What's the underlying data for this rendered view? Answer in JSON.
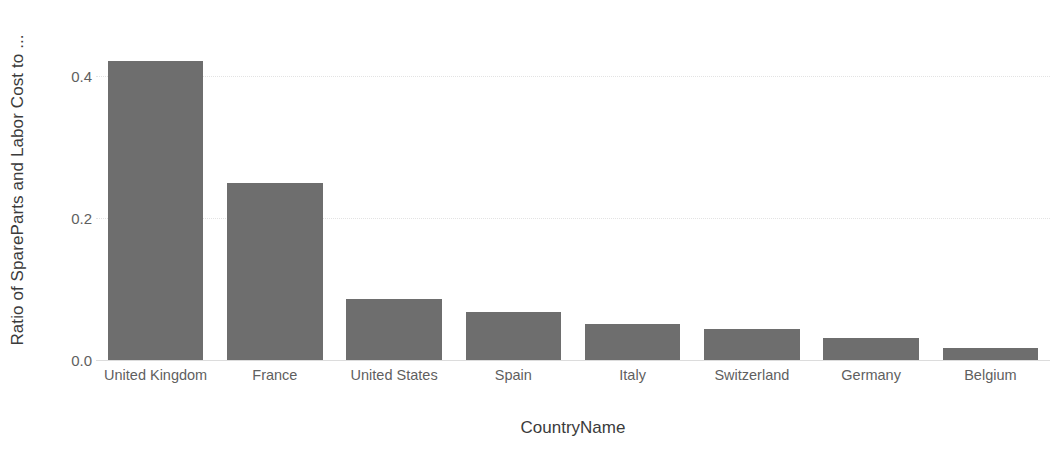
{
  "chart_data": {
    "type": "bar",
    "title": "",
    "subtitle": "",
    "xlabel": "CountryName",
    "ylabel": "Ratio of SpareParts and Labor Cost to ...",
    "categories": [
      "United Kingdom",
      "France",
      "United States",
      "Spain",
      "Italy",
      "Switzerland",
      "Germany",
      "Belgium"
    ],
    "values": [
      0.42,
      0.249,
      0.085,
      0.068,
      0.051,
      0.044,
      0.031,
      0.017
    ],
    "series": [
      {
        "name": "Ratio of SpareParts and Labor Cost to ...",
        "values": [
          0.42,
          0.249,
          0.085,
          0.068,
          0.051,
          0.044,
          0.031,
          0.017
        ]
      }
    ],
    "ylim": [
      0.0,
      0.48
    ],
    "xlim": [
      0,
      8
    ],
    "y_ticks": [
      0.0,
      0.2,
      0.4
    ],
    "y_tick_labels": [
      "0.0",
      "0.2",
      "0.4"
    ],
    "grid": "horizontal-dotted",
    "legend": "none",
    "bar_color": "#6e6e6e",
    "grid_color": "#e3e3e3",
    "axis_color": "#dcdcdc",
    "tick_label_color": "#5f5f5f",
    "axis_title_color": "#3b3b3b",
    "background_color": "#ffffff"
  },
  "axes": {
    "y_title": "Ratio of SpareParts and Labor Cost to ...",
    "x_title": "CountryName",
    "y_tick_0": "0.0",
    "y_tick_1": "0.2",
    "y_tick_2": "0.4"
  },
  "x_labels": {
    "b0": "United Kingdom",
    "b1": "France",
    "b2": "United States",
    "b3": "Spain",
    "b4": "Italy",
    "b5": "Switzerland",
    "b6": "Germany",
    "b7": "Belgium"
  }
}
